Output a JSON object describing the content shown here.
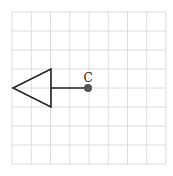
{
  "diagram": {
    "grid": {
      "x0": 12,
      "y0": 12,
      "x1": 166,
      "y1": 164,
      "cols": 8,
      "rows": 8,
      "line_color": "#dcdcdc"
    },
    "shape": {
      "type": "triangle",
      "points": [
        [
          13,
          88
        ],
        [
          51,
          69
        ],
        [
          51,
          107
        ]
      ],
      "stroke": "#222222"
    },
    "segment": {
      "from": [
        51,
        88
      ],
      "to": [
        88,
        88
      ],
      "stroke": "#222222"
    },
    "point": {
      "label": "C",
      "x": 88,
      "y": 88,
      "fill": "#555555"
    }
  }
}
